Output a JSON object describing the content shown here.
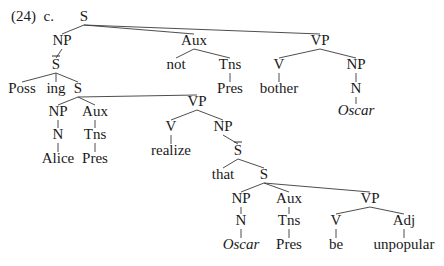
{
  "example": {
    "number": "(24)",
    "letter": "c."
  },
  "tree": {
    "nodes": [
      {
        "id": "S0",
        "label": "S",
        "x": 84,
        "y": 20
      },
      {
        "id": "NP1",
        "label": "NP",
        "x": 62,
        "y": 44
      },
      {
        "id": "Sbar1",
        "label": "S",
        "bar": true,
        "x": 56,
        "y": 68
      },
      {
        "id": "Poss",
        "label": "Poss",
        "x": 22,
        "y": 92
      },
      {
        "id": "ing",
        "label": "ing",
        "x": 56,
        "y": 92
      },
      {
        "id": "S2",
        "label": "S",
        "x": 78,
        "y": 92
      },
      {
        "id": "NP2",
        "label": "NP",
        "x": 58,
        "y": 115
      },
      {
        "id": "N2",
        "label": "N",
        "x": 58,
        "y": 138
      },
      {
        "id": "Alice",
        "label": "Alice",
        "x": 58,
        "y": 162
      },
      {
        "id": "Aux2",
        "label": "Aux",
        "x": 95,
        "y": 115
      },
      {
        "id": "Tns2",
        "label": "Tns",
        "x": 95,
        "y": 138
      },
      {
        "id": "Pres2",
        "label": "Pres",
        "x": 95,
        "y": 162
      },
      {
        "id": "VP2",
        "label": "VP",
        "x": 197,
        "y": 105
      },
      {
        "id": "V2",
        "label": "V",
        "x": 171,
        "y": 130
      },
      {
        "id": "realize",
        "label": "realize",
        "x": 171,
        "y": 154
      },
      {
        "id": "NP3",
        "label": "NP",
        "x": 223,
        "y": 130
      },
      {
        "id": "Sbar3",
        "label": "S",
        "bar": true,
        "x": 238,
        "y": 154
      },
      {
        "id": "that",
        "label": "that",
        "x": 223,
        "y": 178
      },
      {
        "id": "S3",
        "label": "S",
        "x": 264,
        "y": 178
      },
      {
        "id": "NP4",
        "label": "NP",
        "x": 241,
        "y": 202
      },
      {
        "id": "N4",
        "label": "N",
        "x": 241,
        "y": 224
      },
      {
        "id": "Oscar2",
        "label": "Oscar",
        "italic": true,
        "x": 241,
        "y": 248
      },
      {
        "id": "Aux4",
        "label": "Aux",
        "x": 289,
        "y": 202
      },
      {
        "id": "Tns4",
        "label": "Tns",
        "x": 289,
        "y": 224
      },
      {
        "id": "Pres4",
        "label": "Pres",
        "x": 289,
        "y": 248
      },
      {
        "id": "VP4",
        "label": "VP",
        "x": 370,
        "y": 202
      },
      {
        "id": "V4",
        "label": "V",
        "x": 336,
        "y": 224
      },
      {
        "id": "be",
        "label": "be",
        "x": 336,
        "y": 248
      },
      {
        "id": "Adj4",
        "label": "Adj",
        "x": 404,
        "y": 224
      },
      {
        "id": "unpopular",
        "label": "unpopular",
        "x": 404,
        "y": 248
      },
      {
        "id": "Aux1",
        "label": "Aux",
        "x": 194,
        "y": 44
      },
      {
        "id": "not",
        "label": "not",
        "x": 176,
        "y": 68
      },
      {
        "id": "Tns1",
        "label": "Tns",
        "x": 230,
        "y": 68
      },
      {
        "id": "Pres1",
        "label": "Pres",
        "x": 230,
        "y": 92
      },
      {
        "id": "VP1",
        "label": "VP",
        "x": 320,
        "y": 44
      },
      {
        "id": "V1",
        "label": "V",
        "x": 279,
        "y": 68
      },
      {
        "id": "bother",
        "label": "bother",
        "x": 279,
        "y": 92
      },
      {
        "id": "NP5",
        "label": "NP",
        "x": 356,
        "y": 68
      },
      {
        "id": "N5",
        "label": "N",
        "x": 356,
        "y": 92
      },
      {
        "id": "Oscar1",
        "label": "Oscar",
        "italic": true,
        "x": 356,
        "y": 114
      }
    ],
    "edges": [
      [
        "S0",
        "NP1"
      ],
      [
        "S0",
        "Aux1"
      ],
      [
        "S0",
        "VP1"
      ],
      [
        "NP1",
        "Sbar1"
      ],
      [
        "Sbar1",
        "Poss"
      ],
      [
        "Sbar1",
        "ing"
      ],
      [
        "Sbar1",
        "S2"
      ],
      [
        "S2",
        "NP2"
      ],
      [
        "S2",
        "Aux2"
      ],
      [
        "S2",
        "VP2"
      ],
      [
        "NP2",
        "N2"
      ],
      [
        "N2",
        "Alice"
      ],
      [
        "Aux2",
        "Tns2"
      ],
      [
        "Tns2",
        "Pres2"
      ],
      [
        "VP2",
        "V2"
      ],
      [
        "VP2",
        "NP3"
      ],
      [
        "V2",
        "realize"
      ],
      [
        "NP3",
        "Sbar3"
      ],
      [
        "Sbar3",
        "that"
      ],
      [
        "Sbar3",
        "S3"
      ],
      [
        "S3",
        "NP4"
      ],
      [
        "S3",
        "Aux4"
      ],
      [
        "S3",
        "VP4"
      ],
      [
        "NP4",
        "N4"
      ],
      [
        "N4",
        "Oscar2"
      ],
      [
        "Aux4",
        "Tns4"
      ],
      [
        "Tns4",
        "Pres4"
      ],
      [
        "VP4",
        "V4"
      ],
      [
        "VP4",
        "Adj4"
      ],
      [
        "V4",
        "be"
      ],
      [
        "Adj4",
        "unpopular"
      ],
      [
        "Aux1",
        "not"
      ],
      [
        "Aux1",
        "Tns1"
      ],
      [
        "Tns1",
        "Pres1"
      ],
      [
        "VP1",
        "V1"
      ],
      [
        "VP1",
        "NP5"
      ],
      [
        "V1",
        "bother"
      ],
      [
        "NP5",
        "N5"
      ],
      [
        "N5",
        "Oscar1"
      ]
    ]
  }
}
